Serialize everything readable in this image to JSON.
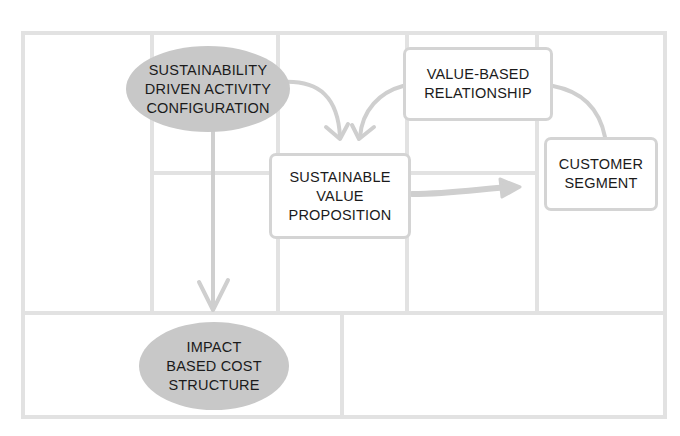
{
  "diagram": {
    "type": "business-model-canvas",
    "colors": {
      "grid_line": "#e2e2e2",
      "arrow": "#cfcfcf",
      "blob_fill": "#c8c8c8",
      "box_border": "#d4d4d4",
      "text": "#1b1b1b"
    },
    "nodes": {
      "activity": {
        "lines": [
          "SUSTAINABILITY",
          "DRIVEN ACTIVITY",
          "CONFIGURATION"
        ],
        "shape": "ellipse-filled"
      },
      "relationship": {
        "lines": [
          "VALUE-BASED",
          "RELATIONSHIP"
        ],
        "shape": "rounded-box"
      },
      "value_proposition": {
        "lines": [
          "SUSTAINABLE",
          "VALUE",
          "PROPOSITION"
        ],
        "shape": "rounded-box"
      },
      "customer": {
        "lines": [
          "CUSTOMER",
          "SEGMENT"
        ],
        "shape": "rounded-box"
      },
      "cost": {
        "lines": [
          "IMPACT",
          "BASED COST",
          "STRUCTURE"
        ],
        "shape": "ellipse-filled"
      }
    },
    "edges": [
      {
        "from": "activity",
        "to": "value_proposition",
        "style": "curved-arrow"
      },
      {
        "from": "relationship",
        "to": "value_proposition",
        "style": "curved-arrow"
      },
      {
        "from": "relationship",
        "to": "customer",
        "style": "curved-line"
      },
      {
        "from": "value_proposition",
        "to": "customer",
        "style": "thick-arrow"
      },
      {
        "from": "activity",
        "to": "cost",
        "style": "straight-arrow"
      }
    ]
  }
}
